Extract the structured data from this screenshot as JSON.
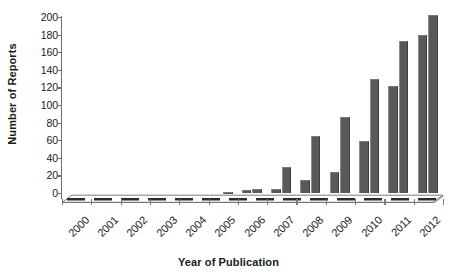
{
  "chart_data": {
    "type": "bar",
    "title": "",
    "clipped_title_remnant": "",
    "xlabel": "Year of Publication",
    "ylabel": "Number of Reports",
    "categories": [
      "2000",
      "2001",
      "2002",
      "2003",
      "2004",
      "2005",
      "2006",
      "2007",
      "2008",
      "2009",
      "2010",
      "2011",
      "2012"
    ],
    "series": [
      {
        "name": "series-1",
        "values": [
          0,
          0,
          0,
          0,
          0,
          0,
          3,
          4,
          15,
          24,
          59,
          122,
          180
        ]
      },
      {
        "name": "series-2",
        "values": [
          0,
          0,
          0,
          0,
          0,
          1,
          5,
          30,
          65,
          86,
          129,
          173,
          202
        ]
      }
    ],
    "ylim": [
      0,
      200
    ],
    "ytick_values": [
      "200",
      "180",
      "160",
      "140",
      "120",
      "100",
      "80",
      "60",
      "40",
      "20",
      "0"
    ],
    "ystep": 20,
    "grid": false,
    "legend": "none",
    "bar_color": "#595959",
    "axis_color": "#6d6d6d",
    "text_color": "#1a1a1a",
    "background": "#ffffff",
    "style": "3d-perspective-floor",
    "xlabel_rotation_deg": -45
  }
}
